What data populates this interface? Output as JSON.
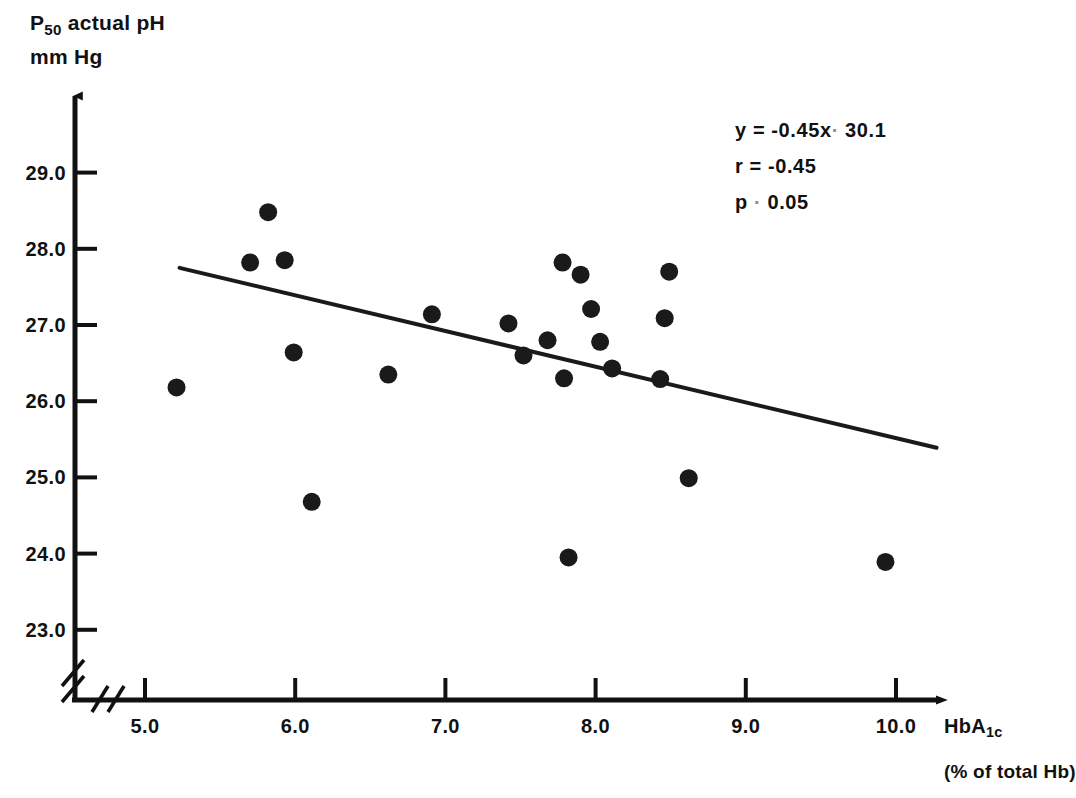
{
  "axes": {
    "y_title_line1_prefix": "P",
    "y_title_line1_sub": "50",
    "y_title_line1_suffix": " actual pH",
    "y_title_line2": "mm Hg",
    "x_title_prefix": "HbA",
    "x_title_sub": "1c",
    "x_title_secondary": "(% of total Hb)"
  },
  "annotation": {
    "equation_lhs": "y = -0.45x",
    "equation_op": "·",
    "equation_rhs": "30.1",
    "correlation": "r  = -0.45",
    "pvalue_lhs": "p",
    "pvalue_op": "·",
    "pvalue_rhs": "0.05"
  },
  "chart_data": {
    "type": "scatter",
    "title": "",
    "xlabel": "HbA1c (% of total Hb)",
    "ylabel": "P50 actual pH, mm Hg",
    "xlim": [
      4.6,
      10.45
    ],
    "ylim": [
      22.55,
      29.55
    ],
    "grid": false,
    "legend": "none",
    "xticks": [
      "5.0",
      "6.0",
      "7.0",
      "8.0",
      "9.0",
      "10.0"
    ],
    "xtick_values": [
      5.0,
      6.0,
      7.0,
      8.0,
      9.0,
      10.0
    ],
    "yticks": [
      "29.0",
      "28.0",
      "27.0",
      "26.0",
      "25.0",
      "24.0",
      "23.0"
    ],
    "ytick_values": [
      29.0,
      28.0,
      27.0,
      26.0,
      25.0,
      24.0,
      23.0
    ],
    "axis_break_x": true,
    "axis_break_y": true,
    "marker": "filled-circle",
    "marker_color": "#1a1a1a",
    "marker_radius_px": 9,
    "points": [
      {
        "x": 5.21,
        "y": 26.18
      },
      {
        "x": 5.7,
        "y": 27.82
      },
      {
        "x": 5.82,
        "y": 28.48
      },
      {
        "x": 5.93,
        "y": 27.85
      },
      {
        "x": 5.99,
        "y": 26.64
      },
      {
        "x": 6.11,
        "y": 24.68
      },
      {
        "x": 6.62,
        "y": 26.35
      },
      {
        "x": 6.91,
        "y": 27.14
      },
      {
        "x": 7.42,
        "y": 27.02
      },
      {
        "x": 7.52,
        "y": 26.6
      },
      {
        "x": 7.68,
        "y": 26.8
      },
      {
        "x": 7.78,
        "y": 27.82
      },
      {
        "x": 7.79,
        "y": 26.3
      },
      {
        "x": 7.82,
        "y": 23.95
      },
      {
        "x": 7.9,
        "y": 27.66
      },
      {
        "x": 7.97,
        "y": 27.21
      },
      {
        "x": 8.03,
        "y": 26.78
      },
      {
        "x": 8.11,
        "y": 26.43
      },
      {
        "x": 8.43,
        "y": 26.29
      },
      {
        "x": 8.46,
        "y": 27.09
      },
      {
        "x": 8.49,
        "y": 27.7
      },
      {
        "x": 8.62,
        "y": 24.99
      },
      {
        "x": 9.93,
        "y": 23.89
      }
    ],
    "regression_line": {
      "slope": -0.45,
      "intercept": 30.1,
      "x_start": 5.23,
      "y_start": 27.75,
      "x_end": 10.27,
      "y_end": 25.39,
      "color": "#1a1a1a",
      "width_px": 4
    }
  }
}
